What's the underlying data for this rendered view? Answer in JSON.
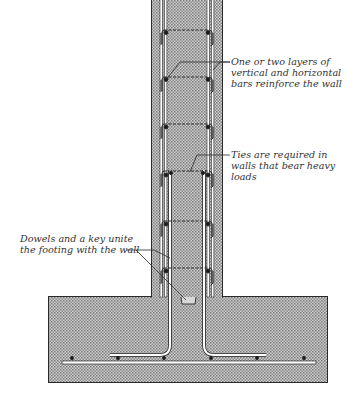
{
  "diagram": {
    "colors": {
      "concrete_fill": "#c8c8c8",
      "concrete_dot": "#6e6e6e",
      "outline": "#2a2a2a",
      "rebar": "#ffffff",
      "text": "#333333"
    },
    "labels": {
      "layers": {
        "lines": [
          "One or two layers of",
          "vertical and horizontal",
          "bars reinforce the wall"
        ]
      },
      "ties": {
        "lines": [
          "Ties are required in",
          "walls that bear heavy",
          "loads"
        ]
      },
      "dowels": {
        "lines": [
          "Dowels and a key unite",
          "the footing with the wall"
        ]
      }
    },
    "components": [
      "wall",
      "footing",
      "vertical-bars",
      "horizontal-ties",
      "dowels",
      "key",
      "footing-bars"
    ]
  }
}
